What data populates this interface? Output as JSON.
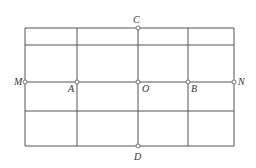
{
  "diagram": {
    "type": "grid-with-points",
    "colors": {
      "line": "#555555",
      "point_fill": "#ffffff",
      "label": "#333333"
    },
    "grid": {
      "vertical_x": [
        25,
        77,
        138,
        188,
        234
      ],
      "horizontal_y": [
        28,
        45,
        82,
        111,
        146
      ]
    },
    "points": [
      {
        "name": "M",
        "label": "M",
        "x": 25,
        "y": 82,
        "lx": 14,
        "ly": 85
      },
      {
        "name": "A",
        "label": "A",
        "x": 77,
        "y": 82,
        "lx": 68,
        "ly": 92
      },
      {
        "name": "O",
        "label": "O",
        "x": 138,
        "y": 82,
        "lx": 142,
        "ly": 92
      },
      {
        "name": "B",
        "label": "B",
        "x": 188,
        "y": 82,
        "lx": 191,
        "ly": 92
      },
      {
        "name": "N",
        "label": "N",
        "x": 234,
        "y": 82,
        "lx": 238,
        "ly": 85
      },
      {
        "name": "C",
        "label": "C",
        "x": 138,
        "y": 28,
        "lx": 133,
        "ly": 23
      },
      {
        "name": "D",
        "label": "D",
        "x": 138,
        "y": 146,
        "lx": 134,
        "ly": 160
      }
    ]
  }
}
